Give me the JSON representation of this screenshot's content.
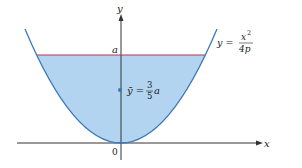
{
  "diagram": {
    "type": "parabolic-region-centroid",
    "axes": {
      "x_label": "x",
      "y_label": "y",
      "origin_label": "0"
    },
    "curve": {
      "label_lhs": "y =",
      "label_num": "x",
      "label_exp": "2",
      "label_den": "4p",
      "color": "#3a78b8"
    },
    "level": {
      "label": "a",
      "color": "#c0304a"
    },
    "region": {
      "fill": "#b3d4f0"
    },
    "centroid": {
      "lhs": "ȳ =",
      "frac_num": "3",
      "frac_den": "5",
      "var": "a",
      "color": "#3a78b8"
    }
  }
}
